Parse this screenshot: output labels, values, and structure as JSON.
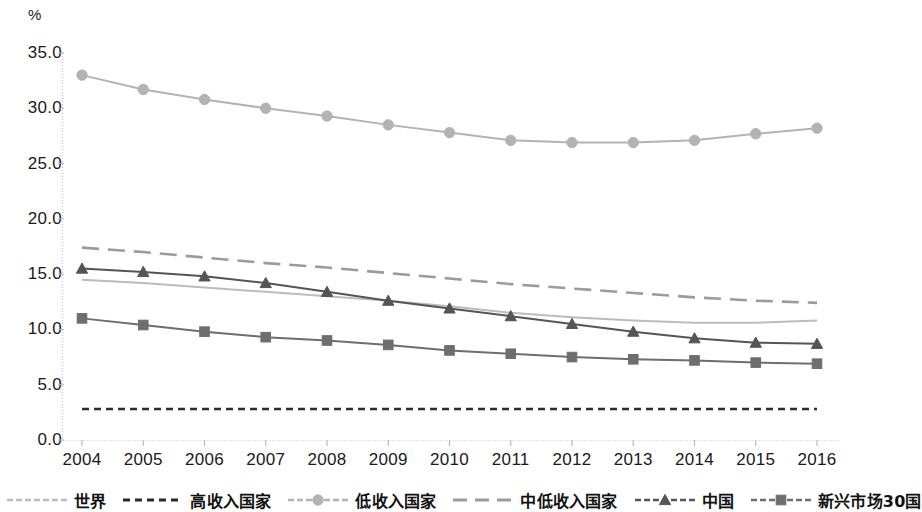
{
  "chart_data": {
    "type": "line",
    "title": "",
    "subtitle": "",
    "xlabel": "",
    "ylabel": "%",
    "unit_label": "%",
    "categories": [
      "2004",
      "2005",
      "2006",
      "2007",
      "2008",
      "2009",
      "2010",
      "2011",
      "2012",
      "2013",
      "2014",
      "2015",
      "2016"
    ],
    "x": [
      2004,
      2005,
      2006,
      2007,
      2008,
      2009,
      2010,
      2011,
      2012,
      2013,
      2014,
      2015,
      2016
    ],
    "ylim": [
      0.0,
      35.0
    ],
    "yticks": [
      "0.0",
      "5.0",
      "10.0",
      "15.0",
      "20.0",
      "25.0",
      "30.0",
      "35.0"
    ],
    "ytick_values": [
      0.0,
      5.0,
      10.0,
      15.0,
      20.0,
      25.0,
      30.0,
      35.0
    ],
    "grid": false,
    "legend_position": "bottom",
    "series": [
      {
        "name": "世界",
        "style": "solid",
        "marker": "none",
        "color": "#bcbcbc",
        "values": [
          14.5,
          14.2,
          13.8,
          13.4,
          13.0,
          12.6,
          12.1,
          11.5,
          11.1,
          10.8,
          10.6,
          10.6,
          10.8
        ]
      },
      {
        "name": "高收入国家",
        "style": "dashed",
        "marker": "none",
        "color": "#2b2b2b",
        "values": [
          2.8,
          2.8,
          2.8,
          2.8,
          2.8,
          2.8,
          2.8,
          2.8,
          2.8,
          2.8,
          2.8,
          2.8,
          2.8
        ]
      },
      {
        "name": "低收入国家",
        "style": "solid",
        "marker": "circle",
        "color": "#b3b3b3",
        "values": [
          33.0,
          31.7,
          30.8,
          30.0,
          29.3,
          28.5,
          27.8,
          27.1,
          26.9,
          26.9,
          27.1,
          27.7,
          28.2
        ]
      },
      {
        "name": "中低收入国家",
        "style": "long-dash",
        "marker": "none",
        "color": "#9b9b9b",
        "values": [
          17.4,
          17.0,
          16.5,
          16.0,
          15.6,
          15.1,
          14.6,
          14.1,
          13.7,
          13.3,
          12.9,
          12.6,
          12.4
        ]
      },
      {
        "name": "中国",
        "style": "solid",
        "marker": "triangle",
        "color": "#555555",
        "values": [
          15.5,
          15.2,
          14.8,
          14.2,
          13.4,
          12.6,
          11.9,
          11.2,
          10.5,
          9.8,
          9.2,
          8.8,
          8.7
        ]
      },
      {
        "name": "新兴市场30国",
        "style": "solid",
        "marker": "square",
        "color": "#6e6e6e",
        "values": [
          11.0,
          10.4,
          9.8,
          9.3,
          9.0,
          8.6,
          8.1,
          7.8,
          7.5,
          7.3,
          7.2,
          7.0,
          6.9
        ]
      }
    ]
  },
  "legend": {
    "items": [
      {
        "label": "世界",
        "swatch": "solid-line-light"
      },
      {
        "label": "高收入国家",
        "swatch": "dashed-line-dark"
      },
      {
        "label": "低收入国家",
        "swatch": "solid-line-circle-marker"
      },
      {
        "label": "中低收入国家",
        "swatch": "long-dash-line-gray"
      },
      {
        "label": "中国",
        "swatch": "solid-line-triangle-marker"
      },
      {
        "label": "新兴市场30国",
        "swatch": "solid-line-square-marker"
      }
    ]
  },
  "axes": {
    "y_unit": "%",
    "y_labels": [
      "35.0",
      "30.0",
      "25.0",
      "20.0",
      "15.0",
      "10.0",
      "5.0",
      "0.0"
    ],
    "x_labels": [
      "2004",
      "2005",
      "2006",
      "2007",
      "2008",
      "2009",
      "2010",
      "2011",
      "2012",
      "2013",
      "2014",
      "2015",
      "2016"
    ]
  }
}
